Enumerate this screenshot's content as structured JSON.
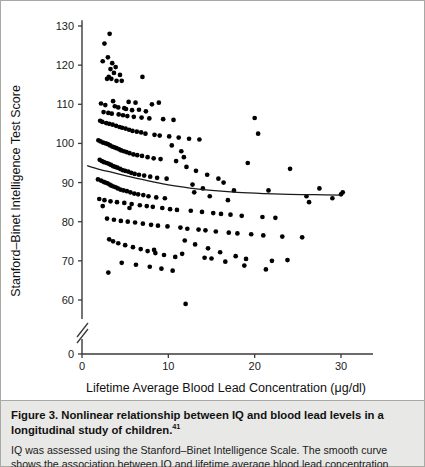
{
  "figure": {
    "caption_title": "Figure 3. Nonlinear relationship between IQ and blood lead levels in a longitudinal study of children.",
    "caption_reference": "41",
    "caption_body": "IQ was assessed using the Stanford–Binet Intelligence Scale. The smooth curve shows the association between IQ and lifetime average blood lead concentration using a penalized-spline model. The"
  },
  "chart_data": {
    "type": "scatter",
    "title": "",
    "xlabel": "Lifetime Average Blood Lead Concentration (μg/dl)",
    "ylabel": "Stanford–Binet Intelligence Test Score",
    "xlim": [
      0,
      36
    ],
    "ylim": [
      55,
      132
    ],
    "xticks": [
      0,
      10,
      20,
      30
    ],
    "xtick_labels": [
      "0",
      "10",
      "20",
      "30"
    ],
    "yticks": [
      60,
      70,
      80,
      90,
      100,
      110,
      120,
      130
    ],
    "ytick_labels": [
      "60",
      "70",
      "80",
      "90",
      "100",
      "110",
      "120",
      "130"
    ],
    "y_axis_break": true,
    "y_axis_origin_label": "0",
    "grid": false,
    "legend": "none",
    "point_color": "#000000",
    "curve_color": "#1a1a1a",
    "series": [
      {
        "name": "Children",
        "x": [
          3.2,
          2.6,
          3.0,
          2.4,
          3.5,
          3.9,
          3.3,
          3.7,
          4.4,
          3.1,
          7.0,
          2.9,
          3.4,
          4.0,
          4.6,
          3.6,
          5.4,
          6.2,
          8.1,
          8.9,
          2.2,
          2.7,
          3.8,
          4.2,
          4.9,
          5.1,
          5.8,
          6.6,
          7.4,
          2.5,
          3.05,
          3.45,
          4.25,
          4.75,
          5.25,
          6.0,
          6.9,
          7.8,
          9.4,
          10.6,
          2.1,
          2.35,
          2.8,
          3.15,
          3.55,
          3.95,
          4.35,
          4.65,
          5.05,
          5.45,
          5.85,
          6.35,
          6.85,
          7.35,
          8.4,
          9.0,
          10.1,
          11.2,
          12.4,
          13.6,
          1.9,
          2.15,
          2.45,
          2.75,
          3.0,
          3.25,
          3.5,
          3.75,
          4.0,
          4.3,
          4.55,
          4.85,
          5.15,
          5.5,
          5.95,
          6.4,
          6.95,
          7.6,
          8.3,
          9.1,
          2.05,
          2.3,
          2.55,
          2.85,
          3.1,
          3.35,
          3.6,
          3.85,
          4.1,
          4.4,
          4.7,
          5.0,
          5.35,
          5.7,
          6.1,
          6.6,
          7.2,
          7.9,
          8.7,
          9.8,
          1.85,
          2.2,
          2.5,
          2.7,
          2.95,
          3.2,
          3.4,
          3.65,
          3.9,
          4.15,
          4.45,
          4.8,
          5.2,
          5.6,
          6.05,
          6.5,
          7.1,
          7.7,
          8.6,
          9.6,
          10.9,
          12.1,
          13.2,
          14.5,
          15.8,
          11.5,
          12.8,
          14.0,
          16.4,
          17.6,
          10.4,
          11.8,
          13.0,
          14.8,
          16.9,
          19.2,
          20.4,
          21.6,
          24.1,
          26.3,
          2.0,
          2.6,
          3.3,
          4.05,
          4.9,
          5.75,
          6.7,
          7.5,
          8.2,
          9.3,
          10.2,
          11.0,
          12.6,
          13.9,
          15.2,
          16.1,
          17.2,
          18.5,
          20.9,
          22.4,
          2.9,
          3.7,
          4.5,
          5.3,
          6.15,
          7.05,
          8.0,
          8.8,
          9.9,
          11.4,
          12.2,
          13.5,
          14.3,
          15.5,
          17.0,
          18.0,
          19.6,
          21.0,
          23.2,
          25.5,
          3.15,
          3.6,
          4.2,
          5.0,
          5.9,
          6.8,
          7.6,
          8.5,
          9.5,
          10.8,
          11.9,
          13.1,
          14.6,
          16.0,
          17.8,
          19.0,
          20.0,
          22.0,
          27.5,
          30.0,
          2.4,
          3.05,
          4.6,
          6.25,
          7.85,
          9.2,
          10.5,
          12.0,
          14.2,
          16.6,
          18.8,
          21.3,
          23.8,
          29.0,
          30.2,
          5.5,
          8.35,
          11.6,
          15.0,
          26.0
        ],
        "y": [
          128,
          125.5,
          122,
          121,
          120.5,
          119.5,
          119,
          118,
          117.5,
          117,
          117,
          116.5,
          116.5,
          116,
          116,
          110.8,
          110.6,
          110.4,
          110,
          110.4,
          110.2,
          109.8,
          109.5,
          109.2,
          109,
          108.8,
          108.5,
          108.6,
          108.2,
          108,
          107.8,
          107.6,
          107.4,
          107.2,
          107,
          106.8,
          106.6,
          106.4,
          106.2,
          106,
          105.8,
          105.5,
          105.2,
          105,
          104.8,
          104.5,
          104.2,
          104,
          103.8,
          103.5,
          103.2,
          103,
          102.8,
          102.5,
          102.2,
          102,
          101.8,
          101.5,
          101.2,
          101,
          100.8,
          100.5,
          100.2,
          100,
          99.8,
          99.5,
          99.2,
          99,
          98.8,
          98.5,
          98.2,
          98,
          97.8,
          97.5,
          97.2,
          97,
          96.8,
          96.5,
          96.2,
          96,
          95.8,
          95.5,
          95.2,
          95,
          94.8,
          94.5,
          94.2,
          94,
          93.8,
          93.5,
          93.2,
          93,
          92.8,
          92.5,
          92.2,
          92,
          91.8,
          91.5,
          91.2,
          91,
          90.8,
          90.5,
          90.2,
          90,
          89.8,
          89.5,
          89.2,
          89,
          88.8,
          88.5,
          88.2,
          88,
          87.8,
          87.5,
          87.2,
          87,
          86.8,
          86.5,
          86.2,
          86,
          95.5,
          94.0,
          93.0,
          92.0,
          91.0,
          98.0,
          89.5,
          88.5,
          90.0,
          88.0,
          99.5,
          96.5,
          87.5,
          86.5,
          85.5,
          95.0,
          102.5,
          88.0,
          93.5,
          85.0,
          85.8,
          85.5,
          85.2,
          85,
          84.8,
          84.5,
          84.2,
          84,
          83.8,
          83.5,
          83.2,
          83,
          82.8,
          82.5,
          82.2,
          82,
          81.8,
          81.5,
          81.2,
          81,
          80.8,
          80.5,
          80.2,
          80,
          79.8,
          79.5,
          79.2,
          79,
          78.8,
          78.5,
          78.2,
          78,
          77.8,
          77.5,
          77.2,
          77,
          76.8,
          76.5,
          76.2,
          76,
          75.5,
          75,
          74.5,
          74,
          73.5,
          73,
          72.5,
          72,
          71.5,
          71,
          75.2,
          74.2,
          73.2,
          72.2,
          71.2,
          70.5,
          106.5,
          70,
          88.5,
          87.0,
          84.0,
          67.0,
          69.5,
          69,
          68.5,
          68,
          67.5,
          59.0,
          70.8,
          69.8,
          68.8,
          67.8,
          70.2,
          86.0,
          87.5,
          83.5,
          72.8,
          71.8,
          70.6,
          86.5
        ]
      }
    ],
    "curve": {
      "name": "penalized-spline fit",
      "x": [
        0.6,
        2.0,
        3.5,
        5.0,
        6.5,
        8.0,
        10.0,
        12.5,
        15.0,
        18.0,
        21.0,
        24.0,
        27.0,
        30.0
      ],
      "y": [
        94.3,
        93.4,
        92.6,
        91.8,
        91.0,
        90.3,
        89.4,
        88.6,
        88.0,
        87.5,
        87.2,
        87.0,
        86.9,
        86.8
      ]
    }
  }
}
